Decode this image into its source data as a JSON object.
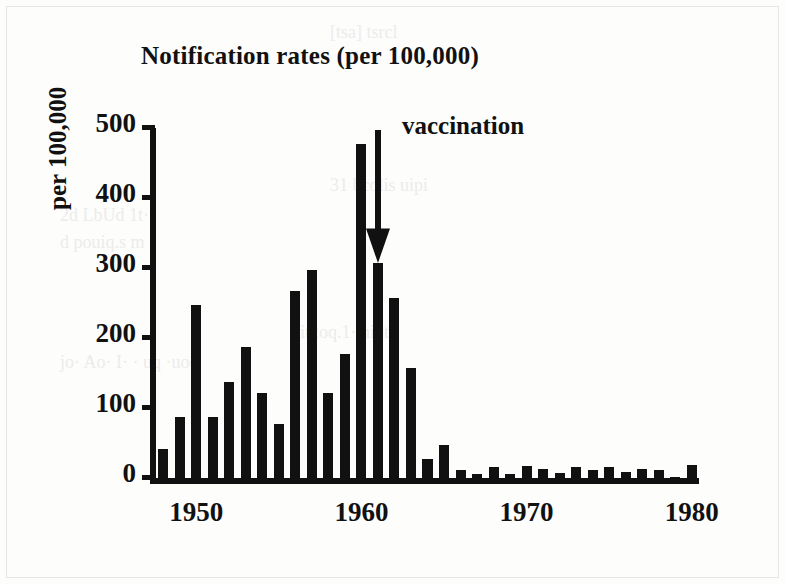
{
  "chart_data": {
    "type": "bar",
    "title": "Notification rates (per 100,000)",
    "xlabel": "",
    "ylabel": "per 100,000",
    "ylim": [
      0,
      500
    ],
    "xlim": [
      1947.5,
      1980.5
    ],
    "ytick_labels": [
      "0",
      "100",
      "200",
      "300",
      "400",
      "500"
    ],
    "ytick_values": [
      0,
      100,
      200,
      300,
      400,
      500
    ],
    "xtick_labels": [
      "1950",
      "1960",
      "1970",
      "1980"
    ],
    "xtick_values": [
      1950,
      1960,
      1970,
      1980
    ],
    "grid": false,
    "legend": null,
    "bar_color": "#111111",
    "categories": [
      1948,
      1949,
      1950,
      1951,
      1952,
      1953,
      1954,
      1955,
      1956,
      1957,
      1958,
      1959,
      1960,
      1961,
      1962,
      1963,
      1964,
      1965,
      1966,
      1967,
      1968,
      1969,
      1970,
      1971,
      1972,
      1973,
      1974,
      1975,
      1976,
      1977,
      1978,
      1979,
      1980
    ],
    "values": [
      45,
      90,
      250,
      90,
      140,
      190,
      125,
      80,
      270,
      300,
      125,
      180,
      480,
      310,
      260,
      160,
      30,
      50,
      15,
      8,
      18,
      8,
      20,
      16,
      10,
      18,
      14,
      18,
      12,
      16,
      14,
      4,
      22
    ],
    "annotations": [
      {
        "text": "vaccination",
        "kind": "down-arrow",
        "at_category": 1961,
        "at_value": 310,
        "from_value": 500
      }
    ]
  },
  "ghost_text": {
    "top": "[tsa] tsrcl",
    "l1": "31 bcolis uipi",
    "l2": "2d LbUd 1t· ",
    "l3": "d pouiq.s m",
    "l4": "iutoq.1· niut",
    "l5": "jo· Ao· I· · uq ·uoq"
  }
}
